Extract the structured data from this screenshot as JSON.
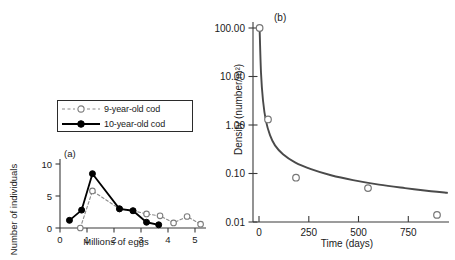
{
  "figure": {
    "background": "#ffffff",
    "axis_color": "#3a3a3a",
    "curve_color": "#4a4a4a"
  },
  "panel_a": {
    "tag": "(a)",
    "legend": {
      "items": [
        {
          "label": "9-year-old cod",
          "style": "dashed-open-circle",
          "color": "#8c8c8c"
        },
        {
          "label": "10-year-old cod",
          "style": "solid-filled-circle",
          "color": "#000000"
        }
      ]
    }
  },
  "panel_b": {
    "tag": "(b)"
  },
  "chart_data": [
    {
      "type": "line",
      "panel": "(a)",
      "title": "",
      "xlabel": "Millions of eggs",
      "ylabel": "Number of individuals",
      "xlim": [
        0,
        5.4
      ],
      "ylim": [
        0,
        10.8
      ],
      "xticks": [
        0,
        1,
        2,
        3,
        4,
        5
      ],
      "xtick_labels": [
        "0",
        "1",
        "2",
        "3",
        "4",
        "5"
      ],
      "yticks": [
        0,
        5,
        10
      ],
      "ytick_labels": [
        "0",
        "5",
        "10"
      ],
      "grid": false,
      "legend_position": "upper-left-outside",
      "series": [
        {
          "name": "9-year-old cod",
          "marker": "open-circle",
          "line": "dashed",
          "color": "#8c8c8c",
          "x": [
            0.75,
            1.2,
            2.2,
            2.7,
            3.2,
            3.7,
            4.2,
            4.7,
            5.2
          ],
          "y": [
            0,
            5.8,
            3.0,
            2.7,
            2.2,
            1.9,
            0.8,
            1.8,
            0.6
          ]
        },
        {
          "name": "10-year-old cod",
          "marker": "filled-circle",
          "line": "solid",
          "color": "#000000",
          "x": [
            0.35,
            0.8,
            1.2,
            2.2,
            2.7,
            3.2,
            3.65
          ],
          "y": [
            1.2,
            2.8,
            8.5,
            3.0,
            2.7,
            0.9,
            0.5
          ]
        }
      ]
    },
    {
      "type": "scatter",
      "panel": "(b)",
      "title": "",
      "xlabel": "Time (days)",
      "ylabel": "Density (number/m²)",
      "yscale": "log",
      "xlim": [
        -30,
        950
      ],
      "ylim": [
        0.008,
        130
      ],
      "xticks": [
        0,
        250,
        500,
        750
      ],
      "xtick_labels": [
        "0",
        "250",
        "500",
        "750"
      ],
      "yticks": [
        0.01,
        0.1,
        1.0,
        10.0,
        100.0
      ],
      "ytick_labels": [
        "0.01",
        "0.10",
        "1.00",
        "10.00",
        "100.00"
      ],
      "grid": false,
      "legend_position": "none",
      "series": [
        {
          "name": "observed density",
          "marker": "open-circle",
          "color": "#777777",
          "x": [
            3,
            45,
            185,
            545,
            890
          ],
          "y": [
            100.0,
            1.3,
            0.082,
            0.05,
            0.014
          ]
        },
        {
          "name": "fitted decay curve",
          "marker": "none",
          "line": "solid",
          "color": "#4a4a4a",
          "x": [
            3,
            10,
            20,
            35,
            55,
            80,
            120,
            180,
            260,
            360,
            470,
            600,
            730,
            860,
            940
          ],
          "y": [
            100.0,
            12.0,
            3.2,
            1.2,
            0.62,
            0.38,
            0.25,
            0.17,
            0.123,
            0.092,
            0.073,
            0.059,
            0.05,
            0.043,
            0.04
          ]
        }
      ]
    }
  ]
}
